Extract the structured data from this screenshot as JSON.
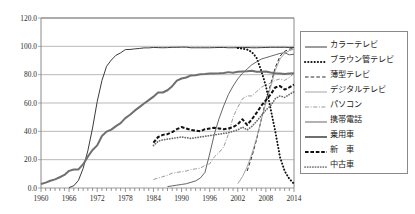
{
  "chart_data": {
    "type": "line",
    "title": "",
    "xlabel": "",
    "ylabel": "",
    "xlim": [
      1960,
      2014
    ],
    "ylim": [
      0,
      120
    ],
    "grid": true,
    "legend_position": "right",
    "y_ticks": [
      "0.0",
      "20.0",
      "40.0",
      "60.0",
      "80.0",
      "100.0",
      "120.0"
    ],
    "x_ticks": [
      "1960",
      "1966",
      "1972",
      "1978",
      "1984",
      "1990",
      "1996",
      "2002",
      "2008",
      "2014"
    ],
    "series": [
      {
        "name": "カラーテレビ",
        "style": "solid-thin",
        "color": "#3b3b3b",
        "x": [
          1966,
          1967,
          1968,
          1969,
          1970,
          1971,
          1972,
          1973,
          1974,
          1975,
          1976,
          1977,
          1978,
          1979,
          1980,
          1981,
          1982,
          1983,
          1984,
          1985,
          1986,
          1987,
          1988,
          1989,
          1990,
          1991,
          1992,
          1993,
          1994,
          1995,
          1996,
          1997,
          1998,
          1999,
          2000,
          2001,
          2002,
          2003,
          2004,
          2005,
          2006,
          2007,
          2008,
          2009,
          2010,
          2011,
          2012,
          2013,
          2014
        ],
        "values": [
          0.3,
          1.6,
          5.4,
          13.9,
          26.3,
          42.3,
          61.1,
          75.8,
          85.9,
          90.3,
          93.7,
          95.4,
          97.7,
          97.8,
          98.2,
          98.5,
          98.9,
          98.9,
          99.2,
          99.1,
          99.0,
          99.1,
          99.3,
          99.3,
          99.4,
          99.4,
          99.0,
          99.0,
          99.0,
          99.0,
          99.0,
          99.1,
          99.2,
          99.2,
          99.0,
          99.0,
          99.1,
          99.1,
          99.2,
          99.0,
          99.0,
          99.1,
          99.2,
          99.3,
          99.3,
          99.3,
          99.3,
          99.2,
          99.2
        ]
      },
      {
        "name": "ブラウン管テレビ",
        "style": "dotted-heavy",
        "color": "#101010",
        "x": [
          2002,
          2003,
          2004,
          2005,
          2006,
          2007,
          2008,
          2009,
          2010,
          2011,
          2012,
          2013,
          2014
        ],
        "values": [
          98.8,
          98.4,
          97.7,
          96.0,
          92.0,
          83.0,
          72.0,
          56.0,
          40.0,
          22.0,
          12.0,
          6.5,
          3.0
        ]
      },
      {
        "name": "薄型テレビ",
        "style": "dashed-medium",
        "color": "#2a2a2a",
        "x": [
          2004,
          2005,
          2006,
          2007,
          2008,
          2009,
          2010,
          2011,
          2012,
          2013,
          2014
        ],
        "values": [
          12.0,
          22.0,
          34.0,
          48.0,
          62.0,
          73.0,
          85.0,
          93.0,
          96.5,
          98.0,
          98.6
        ]
      },
      {
        "name": "デジタルテレビ",
        "style": "solid-light",
        "color": "#9a9a9a",
        "x": [
          2002,
          2003,
          2004,
          2005,
          2006,
          2007,
          2008,
          2009,
          2010,
          2011,
          2012,
          2013,
          2014
        ],
        "values": [
          3.0,
          8.0,
          15.0,
          24.0,
          35.0,
          48.0,
          60.0,
          71.0,
          83.0,
          91.0,
          95.0,
          97.0,
          98.0
        ]
      },
      {
        "name": "パソコン",
        "style": "dashdot-light",
        "color": "#8c8c8c",
        "x": [
          1984,
          1985,
          1986,
          1987,
          1988,
          1989,
          1990,
          1991,
          1992,
          1993,
          1994,
          1995,
          1996,
          1997,
          1998,
          1999,
          2000,
          2001,
          2002,
          2003,
          2004,
          2005,
          2006,
          2007,
          2008,
          2009,
          2010,
          2011,
          2012,
          2013,
          2014
        ],
        "values": [
          6.0,
          7.0,
          8.0,
          9.0,
          10.5,
          11.0,
          11.5,
          12.0,
          13.0,
          13.5,
          14.0,
          16.0,
          17.0,
          22.0,
          25.0,
          29.0,
          38.0,
          50.0,
          57.0,
          63.0,
          65.0,
          65.0,
          68.0,
          71.0,
          73.0,
          74.0,
          76.0,
          77.0,
          76.0,
          78.0,
          81.0
        ]
      },
      {
        "name": "携帯電話",
        "style": "solid-thin2",
        "color": "#555555",
        "x": [
          1987,
          1988,
          1989,
          1990,
          1991,
          1992,
          1993,
          1994,
          1995,
          1996,
          1997,
          1998,
          1999,
          2000,
          2001,
          2002,
          2003,
          2004,
          2005,
          2006,
          2007,
          2008,
          2009,
          2010,
          2011,
          2012,
          2013,
          2014
        ],
        "values": [
          1.0,
          1.5,
          2.0,
          2.5,
          3.0,
          4.0,
          5.0,
          7.0,
          11.0,
          24.0,
          38.0,
          49.0,
          58.0,
          66.0,
          72.0,
          77.0,
          81.0,
          84.0,
          87.0,
          89.0,
          91.0,
          92.0,
          93.0,
          94.0,
          95.0,
          95.5,
          94.0,
          94.5
        ]
      },
      {
        "name": "乗用車",
        "style": "solid-heavy",
        "color": "#6f6f6f",
        "x": [
          1960,
          1961,
          1962,
          1963,
          1964,
          1965,
          1966,
          1967,
          1968,
          1969,
          1970,
          1971,
          1972,
          1973,
          1974,
          1975,
          1976,
          1977,
          1978,
          1979,
          1980,
          1981,
          1982,
          1983,
          1984,
          1985,
          1986,
          1987,
          1988,
          1989,
          1990,
          1991,
          1992,
          1993,
          1994,
          1995,
          1996,
          1997,
          1998,
          1999,
          2000,
          2001,
          2002,
          2003,
          2004,
          2005,
          2006,
          2007,
          2008,
          2009,
          2010,
          2011,
          2012,
          2013,
          2014
        ],
        "values": [
          2.8,
          3.8,
          5.1,
          6.1,
          7.6,
          9.2,
          12.1,
          13.1,
          13.1,
          16.8,
          22.1,
          26.8,
          30.1,
          36.7,
          39.8,
          41.2,
          43.7,
          45.8,
          49.3,
          51.7,
          54.6,
          57.1,
          59.6,
          62.0,
          64.5,
          67.4,
          67.4,
          69.0,
          71.9,
          75.8,
          77.3,
          78.0,
          79.5,
          79.6,
          80.3,
          80.4,
          80.8,
          80.9,
          81.0,
          81.2,
          81.8,
          81.4,
          82.0,
          82.2,
          82.4,
          82.7,
          82.0,
          82.0,
          82.3,
          81.5,
          81.0,
          80.8,
          80.5,
          80.8,
          81.0
        ]
      },
      {
        "name": "新車",
        "style": "dashed-heavy",
        "color": "#111111",
        "x": [
          1984,
          1985,
          1986,
          1987,
          1988,
          1989,
          1990,
          1991,
          1992,
          1993,
          1994,
          1995,
          1996,
          1997,
          1998,
          1999,
          2000,
          2001,
          2002,
          2003,
          2004,
          2005,
          2006,
          2007,
          2008,
          2009,
          2010,
          2011,
          2012,
          2013,
          2014
        ],
        "values": [
          32.0,
          36.0,
          37.5,
          38.0,
          39.5,
          41.5,
          43.0,
          42.0,
          41.0,
          40.5,
          40.0,
          41.5,
          42.0,
          42.5,
          42.0,
          41.5,
          42.0,
          43.0,
          45.0,
          48.5,
          44.5,
          48.5,
          53.0,
          58.0,
          62.0,
          66.0,
          71.0,
          72.0,
          69.5,
          71.0,
          73.0
        ]
      },
      {
        "name": "中古車",
        "style": "dotted-medium",
        "color": "#6a6a6a",
        "x": [
          1984,
          1985,
          1986,
          1987,
          1988,
          1989,
          1990,
          1991,
          1992,
          1993,
          1994,
          1995,
          1996,
          1997,
          1998,
          1999,
          2000,
          2001,
          2002,
          2003,
          2004,
          2005,
          2006,
          2007,
          2008,
          2009,
          2010,
          2011,
          2012,
          2013,
          2014
        ],
        "values": [
          30.0,
          33.0,
          34.0,
          34.5,
          35.0,
          35.5,
          36.0,
          35.5,
          35.0,
          35.5,
          36.0,
          36.5,
          37.0,
          37.5,
          38.0,
          38.5,
          39.0,
          40.0,
          41.0,
          43.0,
          41.0,
          43.5,
          47.0,
          51.0,
          55.0,
          58.0,
          63.0,
          65.0,
          64.0,
          66.0,
          68.0
        ]
      }
    ]
  },
  "legend": {
    "items": [
      {
        "label": "カラーテレビ",
        "swatch": "solid-thin"
      },
      {
        "label": "ブラウン管テレビ",
        "swatch": "dotted-heavy"
      },
      {
        "label": "薄型テレビ",
        "swatch": "dashed-medium"
      },
      {
        "label": "デジタルテレビ",
        "swatch": "solid-light"
      },
      {
        "label": "パソコン",
        "swatch": "dashdot-light"
      },
      {
        "label": "携帯電話",
        "swatch": "solid-thin2"
      },
      {
        "label": "乗用車",
        "swatch": "solid-heavy"
      },
      {
        "label": "新　車",
        "swatch": "dashed-heavy"
      },
      {
        "label": "中古車",
        "swatch": "dotted-medium"
      }
    ]
  }
}
